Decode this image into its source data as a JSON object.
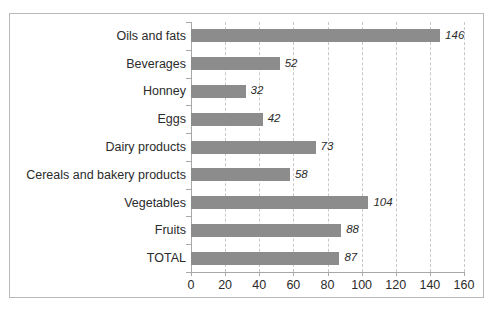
{
  "chart_data": {
    "type": "bar",
    "orientation": "horizontal",
    "title": "",
    "subtitle": "",
    "xlabel": "",
    "ylabel": "",
    "xlim": [
      0,
      160
    ],
    "xticks": [
      0,
      20,
      40,
      60,
      80,
      100,
      120,
      140,
      160
    ],
    "grid": true,
    "grid_axis": "x",
    "grid_style": "dashed",
    "legend": false,
    "legend_position": "none",
    "bar_color": "#8c8c8c",
    "value_label_style": "italic",
    "categories": [
      "Oils and fats",
      "Beverages",
      "Honney",
      "Eggs",
      "Dairy products",
      "Cereals and bakery products",
      "Vegetables",
      "Fruits",
      "TOTAL"
    ],
    "values": [
      146,
      52,
      32,
      42,
      73,
      58,
      104,
      88,
      87
    ],
    "value_labels": [
      "146",
      "52",
      "32",
      "42",
      "73",
      "58",
      "104",
      "88",
      "87"
    ],
    "xtick_labels": [
      "0",
      "20",
      "40",
      "60",
      "80",
      "100",
      "120",
      "140",
      "160"
    ]
  },
  "colors": {
    "bar": "#8c8c8c",
    "grid": "#c8c8c8",
    "axis": "#a8a8a8",
    "border": "#b9b9b9",
    "text": "#2b2b2b",
    "background": "#ffffff"
  }
}
